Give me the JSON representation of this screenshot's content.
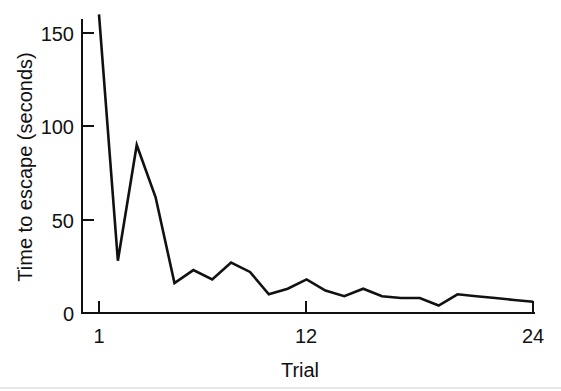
{
  "chart_data": {
    "type": "line",
    "title": "",
    "xlabel": "Trial",
    "ylabel": "Time to escape (seconds)",
    "xlim": [
      1,
      24
    ],
    "ylim": [
      0,
      160
    ],
    "grid": false,
    "legend": "none",
    "line_color": "#111111",
    "x": [
      1,
      2,
      3,
      4,
      5,
      6,
      7,
      8,
      9,
      10,
      11,
      12,
      13,
      14,
      15,
      16,
      17,
      18,
      19,
      20,
      21,
      22,
      23,
      24
    ],
    "xticks": [
      1,
      12,
      24
    ],
    "xticklabels": [
      "1",
      "12",
      "24"
    ],
    "yticks": [
      0,
      50,
      100,
      150
    ],
    "yticklabels": [
      "0",
      "50",
      "100",
      "150"
    ],
    "series": [
      {
        "name": "Time to escape",
        "values": [
          160,
          28,
          90,
          62,
          16,
          23,
          18,
          27,
          22,
          10,
          13,
          18,
          12,
          9,
          13,
          9,
          8,
          8,
          4,
          10,
          9,
          8,
          7,
          6
        ]
      }
    ],
    "annotations": []
  },
  "axes": {
    "y_tick_labels": [
      "150",
      "100",
      "50",
      "0"
    ],
    "x_tick_labels": [
      "1",
      "12",
      "24"
    ],
    "y_axis_title": "Time to escape (seconds)",
    "x_axis_title": "Trial"
  }
}
